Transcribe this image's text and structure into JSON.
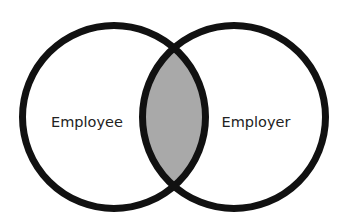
{
  "diagram": {
    "type": "venn",
    "sets": [
      {
        "id": "left",
        "label": "Employee"
      },
      {
        "id": "right",
        "label": "Employer"
      }
    ],
    "intersection": {
      "label": "",
      "fill": "#a9a9a9"
    },
    "colors": {
      "stroke": "#111111",
      "background": "#ffffff",
      "text": "#222222"
    }
  }
}
